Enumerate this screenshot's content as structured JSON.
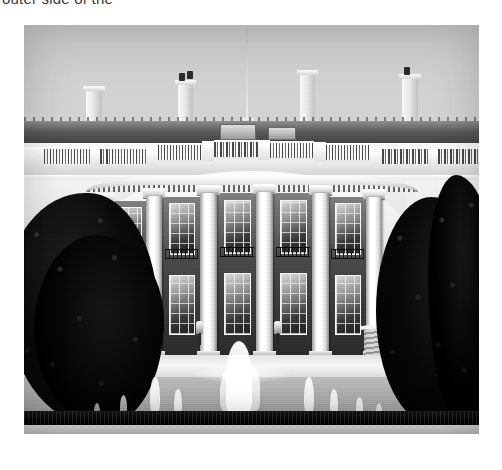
{
  "page": {
    "background_color": "#ffffff",
    "width": 502,
    "height": 470
  },
  "caption": {
    "text": "outer side of the",
    "truncated": true,
    "color": "#3a3a3a"
  },
  "photo": {
    "name": "white-house-south-portico-photograph",
    "alt": "Black and white photograph of the White House South Portico with its curved colonnade, balustrade roofline, chimneys, flagpole, flanking dark trees, and a water fountain on the South Lawn in the foreground",
    "x": 24,
    "y": 25,
    "width": 455,
    "height": 409,
    "color_mode": "black-and-white",
    "colors": {
      "sky": "#c8c8c8",
      "stone_light": "#f2f2f2",
      "stone_mid": "#c4c4c4",
      "shadow": "#2e2e2e",
      "foliage": "#0d0d0d",
      "water_white": "#ffffff",
      "lawn": "#a3a3a3"
    },
    "elements": {
      "sky_label": "overcast sky",
      "roofline_label": "roofline with mechanical equipment",
      "flagpole_label": "flagpole",
      "chimneys": [
        {
          "name": "chimney-left",
          "x": 62,
          "y": 62,
          "width": 16,
          "height": 42
        },
        {
          "name": "chimney-center-left",
          "x": 154,
          "y": 58,
          "width": 15,
          "height": 46
        },
        {
          "name": "chimney-center-right",
          "x": 276,
          "y": 48,
          "width": 15,
          "height": 56
        },
        {
          "name": "chimney-right",
          "x": 378,
          "y": 52,
          "width": 16,
          "height": 52
        }
      ],
      "balustrade_label": "stone balustrade parapet",
      "entablature_label": "entablature with dentil molding",
      "columns": [
        {
          "name": "column-1",
          "x": 72,
          "y": 176,
          "width": 15,
          "height": 158
        },
        {
          "name": "column-2",
          "x": 122,
          "y": 170,
          "width": 16,
          "height": 164
        },
        {
          "name": "column-3",
          "x": 176,
          "y": 166,
          "width": 17,
          "height": 168
        },
        {
          "name": "column-4",
          "x": 232,
          "y": 164,
          "width": 17,
          "height": 170
        },
        {
          "name": "column-5",
          "x": 288,
          "y": 166,
          "width": 17,
          "height": 168
        },
        {
          "name": "column-6",
          "x": 342,
          "y": 170,
          "width": 16,
          "height": 164
        }
      ],
      "windows_label": "tall portico windows with balcony railings",
      "trees_label": "dark evergreen trees framing both sides",
      "terrace_label": "stone terrace and steps",
      "lawn_label": "south lawn",
      "hedge_label": "dark hedge row",
      "fountain_label": "south lawn fountain with water jets",
      "fountain_jets": 9
    }
  }
}
